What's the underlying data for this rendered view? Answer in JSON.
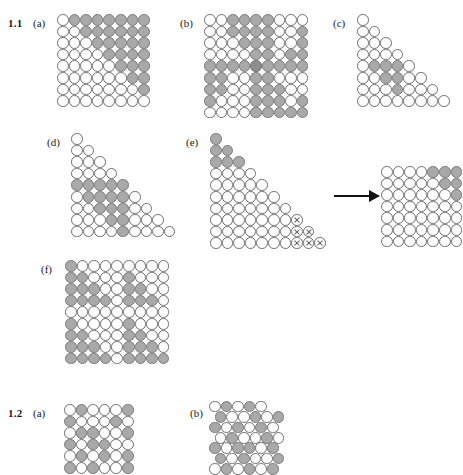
{
  "figure": {
    "background": "#ffffff",
    "fill_color": "#a9a9a9",
    "fill_color_dark": "#8e8e8e",
    "outline_color": "#6e6e6e",
    "arrow_color": "#111111"
  },
  "sections": [
    {
      "id": "sec-1-1",
      "number": "1.1"
    },
    {
      "id": "sec-1-2",
      "number": "1.2"
    }
  ],
  "panels": {
    "p1a": {
      "label": "(a)",
      "cols": 8,
      "rows": 8,
      "cell": 11.6
    },
    "p1b": {
      "label": "(b)",
      "cols": 9,
      "rows": 9,
      "cell": 11.6
    },
    "p1c": {
      "label": "(c)",
      "cols": 8,
      "rows": 8,
      "cell": 11.6
    },
    "p1d": {
      "label": "(d)",
      "cols": 9,
      "rows": 9,
      "cell": 11.6
    },
    "p1e": {
      "label": "(e)",
      "cols": 10,
      "rows": 10,
      "cell": 11.6
    },
    "p1e_result": {
      "label": "",
      "cols": 7,
      "rows": 7,
      "cell": 11.6
    },
    "p1f": {
      "label": "(f)",
      "cols": 9,
      "rows": 9,
      "cell": 11.6
    },
    "p2a": {
      "label": "(a)",
      "cols": 6,
      "rows": 6,
      "cell": 11.6
    },
    "p2b": {
      "label": "(b)",
      "cols": 7,
      "rows": 7,
      "cell": 11.6
    }
  },
  "chart_data": {
    "type": "diagram",
    "legend": {
      "open": "unfilled circle",
      "filled": "gray filled circle",
      "crossed": "circle with X"
    },
    "grids": {
      "p1a": {
        "type": "square",
        "rows": 8,
        "cols": 8,
        "states": [
          [
            "o",
            "f",
            "f",
            "f",
            "f",
            "f",
            "f",
            "f"
          ],
          [
            "o",
            "o",
            "f",
            "f",
            "f",
            "f",
            "f",
            "f"
          ],
          [
            "o",
            "o",
            "o",
            "f",
            "f",
            "f",
            "f",
            "f"
          ],
          [
            "o",
            "o",
            "o",
            "o",
            "f",
            "f",
            "f",
            "f"
          ],
          [
            "o",
            "o",
            "o",
            "o",
            "o",
            "f",
            "f",
            "f"
          ],
          [
            "o",
            "o",
            "o",
            "o",
            "o",
            "o",
            "f",
            "f"
          ],
          [
            "o",
            "o",
            "o",
            "o",
            "o",
            "o",
            "o",
            "f"
          ],
          [
            "o",
            "o",
            "o",
            "o",
            "o",
            "o",
            "o",
            "o"
          ]
        ]
      },
      "p1b": {
        "type": "square",
        "rows": 9,
        "cols": 9,
        "states": [
          [
            "o",
            "o",
            "f",
            "f",
            "f",
            "f",
            "o",
            "o",
            "o"
          ],
          [
            "o",
            "o",
            "f",
            "f",
            "f",
            "f",
            "o",
            "o",
            "f"
          ],
          [
            "o",
            "o",
            "o",
            "f",
            "f",
            "f",
            "o",
            "o",
            "f"
          ],
          [
            "o",
            "o",
            "o",
            "o",
            "f",
            "f",
            "o",
            "f",
            "f"
          ],
          [
            "f",
            "f",
            "f",
            "f",
            "d",
            "f",
            "f",
            "f",
            "f"
          ],
          [
            "f",
            "f",
            "o",
            "o",
            "f",
            "f",
            "o",
            "o",
            "o"
          ],
          [
            "f",
            "f",
            "o",
            "o",
            "f",
            "f",
            "f",
            "o",
            "o"
          ],
          [
            "f",
            "o",
            "o",
            "o",
            "f",
            "f",
            "f",
            "o",
            "f"
          ],
          [
            "o",
            "o",
            "o",
            "o",
            "f",
            "f",
            "f",
            "f",
            "f"
          ]
        ]
      },
      "p1c": {
        "type": "triangle",
        "rows": 8,
        "note": "row i has i circles",
        "states": [
          [
            "o"
          ],
          [
            "o",
            "o"
          ],
          [
            "o",
            "o",
            "o"
          ],
          [
            "o",
            "o",
            "o",
            "o"
          ],
          [
            "o",
            "f",
            "f",
            "f",
            "o"
          ],
          [
            "o",
            "o",
            "f",
            "f",
            "o",
            "o"
          ],
          [
            "o",
            "o",
            "o",
            "f",
            "o",
            "o",
            "o"
          ],
          [
            "o",
            "o",
            "o",
            "o",
            "o",
            "o",
            "o",
            "o"
          ]
        ]
      },
      "p1d": {
        "type": "triangle",
        "rows": 9,
        "note": "row i has i circles",
        "states": [
          [
            "o"
          ],
          [
            "o",
            "o"
          ],
          [
            "o",
            "o",
            "o"
          ],
          [
            "o",
            "o",
            "o",
            "o"
          ],
          [
            "f",
            "f",
            "f",
            "f",
            "f"
          ],
          [
            "o",
            "f",
            "f",
            "f",
            "f",
            "o"
          ],
          [
            "o",
            "o",
            "f",
            "f",
            "f",
            "o",
            "o"
          ],
          [
            "o",
            "o",
            "o",
            "f",
            "f",
            "o",
            "o",
            "o"
          ],
          [
            "o",
            "o",
            "o",
            "o",
            "f",
            "o",
            "o",
            "o",
            "o"
          ]
        ]
      },
      "p1e": {
        "type": "triangle",
        "rows": 10,
        "note": "row i has i circles",
        "states": [
          [
            "f"
          ],
          [
            "f",
            "f"
          ],
          [
            "f",
            "f",
            "f"
          ],
          [
            "o",
            "o",
            "o",
            "o"
          ],
          [
            "o",
            "o",
            "o",
            "o",
            "o"
          ],
          [
            "o",
            "o",
            "o",
            "o",
            "o",
            "o"
          ],
          [
            "o",
            "o",
            "o",
            "o",
            "o",
            "o",
            "o"
          ],
          [
            "o",
            "o",
            "o",
            "o",
            "o",
            "o",
            "o",
            "x"
          ],
          [
            "o",
            "o",
            "o",
            "o",
            "o",
            "o",
            "o",
            "x",
            "x"
          ],
          [
            "o",
            "o",
            "o",
            "o",
            "o",
            "o",
            "o",
            "x",
            "x",
            "x"
          ]
        ]
      },
      "p1e_result": {
        "type": "square",
        "rows": 7,
        "cols": 7,
        "states": [
          [
            "o",
            "o",
            "o",
            "o",
            "f",
            "f",
            "f"
          ],
          [
            "o",
            "o",
            "o",
            "o",
            "o",
            "f",
            "f"
          ],
          [
            "o",
            "o",
            "o",
            "o",
            "o",
            "o",
            "f"
          ],
          [
            "o",
            "o",
            "o",
            "o",
            "o",
            "o",
            "o"
          ],
          [
            "o",
            "o",
            "o",
            "o",
            "o",
            "o",
            "o"
          ],
          [
            "o",
            "o",
            "o",
            "o",
            "o",
            "o",
            "o"
          ],
          [
            "o",
            "o",
            "o",
            "o",
            "o",
            "o",
            "o"
          ]
        ]
      },
      "p1f": {
        "type": "square",
        "rows": 9,
        "cols": 9,
        "states": [
          [
            "f",
            "o",
            "o",
            "o",
            "o",
            "o",
            "o",
            "o",
            "o"
          ],
          [
            "f",
            "f",
            "o",
            "o",
            "o",
            "f",
            "o",
            "o",
            "o"
          ],
          [
            "f",
            "f",
            "f",
            "o",
            "o",
            "f",
            "f",
            "o",
            "o"
          ],
          [
            "f",
            "f",
            "f",
            "f",
            "o",
            "f",
            "f",
            "f",
            "o"
          ],
          [
            "o",
            "o",
            "o",
            "o",
            "o",
            "o",
            "o",
            "o",
            "o"
          ],
          [
            "f",
            "o",
            "o",
            "o",
            "o",
            "f",
            "o",
            "o",
            "o"
          ],
          [
            "f",
            "f",
            "o",
            "o",
            "o",
            "f",
            "f",
            "o",
            "o"
          ],
          [
            "f",
            "f",
            "f",
            "o",
            "o",
            "f",
            "f",
            "f",
            "o"
          ],
          [
            "f",
            "f",
            "f",
            "f",
            "o",
            "f",
            "f",
            "f",
            "f"
          ]
        ]
      },
      "p2a": {
        "type": "square",
        "rows": 6,
        "cols": 6,
        "states": [
          [
            "o",
            "f",
            "o",
            "o",
            "o",
            "f"
          ],
          [
            "f",
            "o",
            "o",
            "o",
            "f",
            "o"
          ],
          [
            "o",
            "f",
            "f",
            "o",
            "o",
            "f"
          ],
          [
            "f",
            "o",
            "f",
            "f",
            "o",
            "o"
          ],
          [
            "o",
            "f",
            "o",
            "f",
            "o",
            "f"
          ],
          [
            "f",
            "o",
            "f",
            "o",
            "o",
            "f"
          ]
        ]
      },
      "p2b": {
        "type": "hex",
        "rows": 7,
        "note": "offset rows; odd rows indented by half a cell",
        "states": [
          [
            "o",
            "f",
            "o",
            "f",
            "o"
          ],
          [
            "f",
            "o",
            "o",
            "f",
            "o",
            "f"
          ],
          [
            "f",
            "o",
            "f",
            "o",
            "f",
            "o"
          ],
          [
            "o",
            "f",
            "o",
            "o",
            "f",
            "o"
          ],
          [
            "f",
            "o",
            "f",
            "f",
            "o",
            "f"
          ],
          [
            "f",
            "o",
            "f",
            "o",
            "o",
            "f"
          ],
          [
            "o",
            "f",
            "o",
            "f",
            "o",
            "f"
          ]
        ]
      }
    }
  }
}
